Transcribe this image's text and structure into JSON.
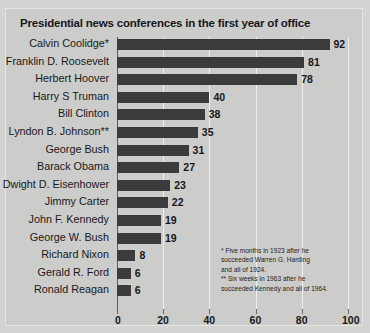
{
  "chart_data": {
    "type": "bar",
    "orientation": "horizontal",
    "title": "Presidential news conferences in the first year of office",
    "xlabel": "",
    "ylabel": "",
    "xlim": [
      0,
      100
    ],
    "xticks": [
      0,
      20,
      40,
      60,
      80,
      100
    ],
    "grid": true,
    "legend": null,
    "categories": [
      "Calvin Coolidge*",
      "Franklin D. Roosevelt",
      "Herbert Hoover",
      "Harry S Truman",
      "Bill Clinton",
      "Lyndon B. Johnson**",
      "George Bush",
      "Barack Obama",
      "Dwight D. Eisenhower",
      "Jimmy Carter",
      "John F. Kennedy",
      "George W. Bush",
      "Richard Nixon",
      "Gerald R. Ford",
      "Ronald Reagan"
    ],
    "values": [
      92,
      81,
      78,
      40,
      38,
      35,
      31,
      27,
      23,
      22,
      19,
      19,
      8,
      6,
      6
    ],
    "annotations": [
      "* Five months in 1923 after he succeeded Warren G. Harding and all of 1924.",
      "** Six weeks in 1963 after he succeeded Kennedy and all of 1964."
    ],
    "bar_color": "#3b3b3c",
    "background_color": "#cccccb"
  },
  "footnote": {
    "line1": "* Five months in 1923 after he",
    "line2": "succeeded Warren G. Harding",
    "line3": "and all of 1924.",
    "line4": "** Six weeks in 1963 after he",
    "line5": "succeeded Kennedy and all of 1964."
  }
}
